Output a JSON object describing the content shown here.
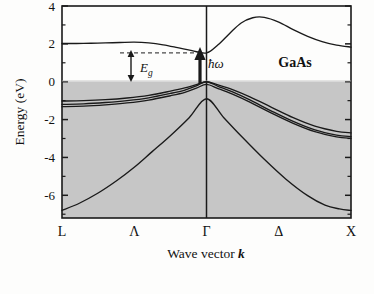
{
  "figure": {
    "material_label": "GaAs",
    "ylabel": "Energy (eV)",
    "xlabel_prefix": "Wave vector ",
    "xlabel_symbol": "k",
    "gap_label": "E",
    "gap_label_sub": "g",
    "photon_label": "ħω",
    "colors": {
      "curve": "#1a1a1a",
      "frame": "#1a1a1a",
      "filled_band_shading": "#c6c6c6",
      "background": "#ffffff",
      "dashed_guide": "#4a4a4a"
    }
  },
  "chart_data": {
    "type": "line",
    "xlabel": "Wave vector k",
    "ylabel": "Energy (eV)",
    "ylim": [
      -7.2,
      4.0
    ],
    "xlim": [
      0,
      2
    ],
    "yticks": [
      4,
      2,
      0,
      -2,
      -4,
      -6
    ],
    "yticklabels": [
      "4",
      "2",
      "0",
      "-2",
      "-4",
      "-6"
    ],
    "yminorticks": [
      3,
      1,
      -1,
      -3,
      -5,
      -7
    ],
    "xticks": [
      0,
      0.5,
      1,
      1.5,
      2
    ],
    "xticklabels": [
      "L",
      "Λ",
      "Γ",
      "Δ",
      "X"
    ],
    "grid": false,
    "legend": null,
    "annotations": [
      {
        "text": "GaAs",
        "x": 1.43,
        "y": 2.55,
        "bold": true
      },
      {
        "text": "Eg",
        "x": 0.78,
        "y": 1.05,
        "italic": true
      },
      {
        "text": "ħω",
        "x": 1.09,
        "y": 1.55,
        "italic": true
      }
    ],
    "shaded_region": {
      "description": "filled valence bands",
      "ymin": -7.2,
      "ymax": 0.0,
      "color": "#c6c6c6"
    },
    "markers": {
      "band_gap_eV": 1.52,
      "gap_arrow_x": 0.72,
      "dashed_line_y": 1.52,
      "photon_arrow_x": 1.03,
      "gamma_vertical_line_x": 1.0
    },
    "series": [
      {
        "name": "conduction band",
        "x": [
          0.0,
          0.1,
          0.2,
          0.3,
          0.4,
          0.5,
          0.6,
          0.7,
          0.8,
          0.9,
          1.0,
          1.08,
          1.16,
          1.24,
          1.32,
          1.4,
          1.5,
          1.6,
          1.7,
          1.8,
          1.9,
          2.0
        ],
        "values": [
          2.02,
          2.02,
          2.03,
          2.05,
          2.07,
          2.09,
          2.05,
          1.95,
          1.8,
          1.64,
          1.52,
          1.95,
          2.55,
          3.1,
          3.38,
          3.4,
          3.15,
          2.75,
          2.4,
          2.12,
          1.93,
          1.83
        ]
      },
      {
        "name": "heavy hole band",
        "x": [
          0.0,
          0.15,
          0.3,
          0.45,
          0.6,
          0.75,
          0.85,
          0.93,
          1.0,
          1.08,
          1.18,
          1.3,
          1.45,
          1.6,
          1.75,
          1.9,
          2.0
        ],
        "values": [
          -1.02,
          -1.0,
          -0.95,
          -0.86,
          -0.72,
          -0.5,
          -0.33,
          -0.15,
          0.0,
          -0.17,
          -0.42,
          -0.8,
          -1.35,
          -1.9,
          -2.35,
          -2.62,
          -2.7
        ]
      },
      {
        "name": "light hole band",
        "x": [
          0.0,
          0.15,
          0.3,
          0.45,
          0.6,
          0.75,
          0.85,
          0.93,
          1.0,
          1.08,
          1.18,
          1.3,
          1.45,
          1.6,
          1.75,
          1.9,
          2.0
        ],
        "values": [
          -1.2,
          -1.17,
          -1.1,
          -1.0,
          -0.85,
          -0.62,
          -0.44,
          -0.22,
          0.0,
          -0.24,
          -0.54,
          -0.96,
          -1.55,
          -2.1,
          -2.55,
          -2.82,
          -2.9
        ]
      },
      {
        "name": "split-off band",
        "x": [
          0.0,
          0.15,
          0.3,
          0.45,
          0.6,
          0.75,
          0.85,
          0.93,
          1.0,
          1.08,
          1.18,
          1.3,
          1.45,
          1.6,
          1.75,
          1.9,
          2.0
        ],
        "values": [
          -1.32,
          -1.29,
          -1.22,
          -1.12,
          -0.97,
          -0.74,
          -0.56,
          -0.34,
          -0.14,
          -0.36,
          -0.66,
          -1.08,
          -1.66,
          -2.2,
          -2.64,
          -2.91,
          -2.99
        ]
      },
      {
        "name": "lowest valence band",
        "x": [
          0.0,
          0.12,
          0.25,
          0.38,
          0.5,
          0.62,
          0.75,
          0.88,
          1.0,
          1.12,
          1.25,
          1.4,
          1.55,
          1.7,
          1.82,
          1.92,
          2.0
        ],
        "values": [
          -6.8,
          -6.42,
          -5.88,
          -5.22,
          -4.52,
          -3.72,
          -2.85,
          -1.9,
          -0.9,
          -1.9,
          -2.95,
          -4.1,
          -5.15,
          -6.02,
          -6.52,
          -6.72,
          -6.8
        ]
      }
    ]
  }
}
